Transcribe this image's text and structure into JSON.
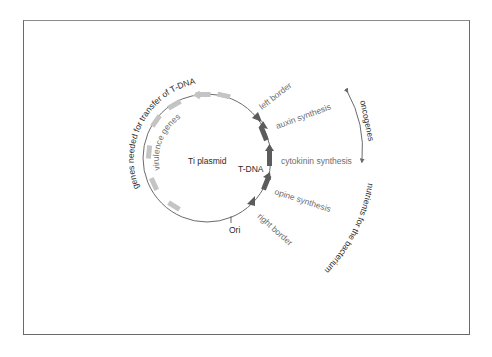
{
  "figure": {
    "title": "Ti plasmid",
    "center_label": "Ti plasmid",
    "segment_label": "T-DNA",
    "origin_label": "Ori",
    "colors": {
      "frame": "#6a6a6a",
      "backbone": "#6b6b6b",
      "virulence_genes": "#c4c4c4",
      "t_dna_genes": "#5c5c5c",
      "dark_text": "#2a2a2a",
      "gray_text": "#6e6e6e"
    }
  },
  "labels": {
    "virulence_genes": "virulence genes",
    "transfer_genes": "genes needed for transfer of T-DNA",
    "left_border": "left border",
    "right_border": "right border",
    "auxin": "auxin synthesis",
    "cytokinin": "cytokinin synthesis",
    "opine": "opine synthesis",
    "oncogenes": "oncogenes",
    "nutrients": "nutrients for the bacterium"
  }
}
